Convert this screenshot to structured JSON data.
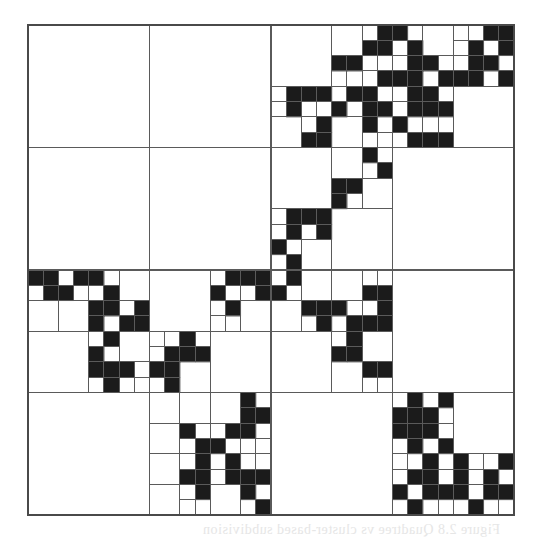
{
  "figure": {
    "type": "quadtree-decomposition",
    "grid_size": 32,
    "major_divisions": 4,
    "colors": {
      "foreground": "#1b1b1b",
      "background": "#ffffff",
      "line": "#5a5a5a"
    },
    "black_cells_by_row": [
      [
        23,
        24,
        30,
        31
      ],
      [
        22,
        23,
        25,
        29,
        31
      ],
      [
        20,
        21,
        25,
        26,
        29,
        30
      ],
      [
        23,
        24,
        25,
        27,
        28,
        29,
        31
      ],
      [
        17,
        18,
        19,
        21,
        22,
        25,
        26
      ],
      [
        17,
        20,
        22,
        23,
        25,
        26,
        27
      ],
      [
        19,
        22,
        24
      ],
      [
        18,
        19,
        25,
        26,
        27
      ],
      [
        22
      ],
      [
        23
      ],
      [
        20,
        21
      ],
      [
        20
      ],
      [
        17,
        18,
        19
      ],
      [
        17,
        19
      ],
      [
        16
      ],
      [
        17
      ],
      [
        0,
        1,
        3,
        4,
        13,
        14,
        15,
        17
      ],
      [
        1,
        2,
        5,
        12,
        15,
        16,
        22,
        23
      ],
      [
        4,
        5,
        7,
        13,
        18,
        19,
        20,
        23
      ],
      [
        4,
        6,
        7,
        19,
        21,
        22,
        23
      ],
      [
        5,
        10,
        21
      ],
      [
        4,
        9,
        10,
        11,
        20,
        21
      ],
      [
        4,
        5,
        6,
        8,
        9,
        22,
        23
      ],
      [
        5,
        9
      ],
      [
        14,
        25,
        27
      ],
      [
        14,
        15,
        24,
        25,
        26
      ],
      [
        10,
        13,
        14,
        24,
        25,
        26
      ],
      [
        11,
        12,
        25,
        27
      ],
      [
        11,
        13,
        26,
        28,
        31
      ],
      [
        10,
        11,
        13,
        14,
        15,
        25,
        26,
        28,
        30
      ],
      [
        11,
        14,
        24,
        26,
        27,
        28,
        30,
        31
      ],
      [
        15,
        25,
        29
      ]
    ]
  },
  "caption": {
    "text": "Figure 2.8 Quadtree vs cluster-based subdivision"
  }
}
